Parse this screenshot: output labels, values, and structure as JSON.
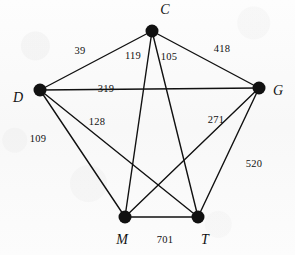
{
  "figure": {
    "width": 295,
    "height": 255,
    "background_color": "#fbfbfb",
    "ink_color": "#111111"
  },
  "nodes": [
    {
      "id": "C",
      "label": "C",
      "cx": 152,
      "cy": 31,
      "r": 6.5,
      "label_x": 165,
      "label_y": 10
    },
    {
      "id": "D",
      "label": "D",
      "cx": 40,
      "cy": 90,
      "r": 6.5,
      "label_x": 18,
      "label_y": 98
    },
    {
      "id": "G",
      "label": "G",
      "cx": 259,
      "cy": 88,
      "r": 6.5,
      "label_x": 278,
      "label_y": 91
    },
    {
      "id": "M",
      "label": "M",
      "cx": 125,
      "cy": 217,
      "r": 6.5,
      "label_x": 122,
      "label_y": 240
    },
    {
      "id": "T",
      "label": "T",
      "cx": 198,
      "cy": 217,
      "r": 6.5,
      "label_x": 205,
      "label_y": 240
    }
  ],
  "edges": [
    {
      "from": "D",
      "to": "C",
      "weight": "39",
      "label_x": 80,
      "label_y": 50
    },
    {
      "from": "C",
      "to": "M",
      "weight": "119",
      "label_x": 133,
      "label_y": 55
    },
    {
      "from": "C",
      "to": "T",
      "weight": "105",
      "label_x": 169,
      "label_y": 56
    },
    {
      "from": "C",
      "to": "G",
      "weight": "418",
      "label_x": 222,
      "label_y": 48
    },
    {
      "from": "D",
      "to": "G",
      "weight": "319",
      "label_x": 106,
      "label_y": 88
    },
    {
      "from": "D",
      "to": "T",
      "weight": "128",
      "label_x": 97,
      "label_y": 121
    },
    {
      "from": "D",
      "to": "M",
      "weight": "109",
      "label_x": 38,
      "label_y": 138
    },
    {
      "from": "G",
      "to": "M",
      "weight": "271",
      "label_x": 216,
      "label_y": 119
    },
    {
      "from": "G",
      "to": "T",
      "weight": "520",
      "label_x": 254,
      "label_y": 163
    },
    {
      "from": "M",
      "to": "T",
      "weight": "701",
      "label_x": 165,
      "label_y": 239
    }
  ],
  "chart_data": {
    "type": "diagram",
    "graph_type": "weighted-complete-graph",
    "vertex_count": 5,
    "edge_count": 10,
    "vertices": [
      "C",
      "D",
      "G",
      "M",
      "T"
    ],
    "weighted_edges": [
      {
        "endpoints": [
          "D",
          "C"
        ],
        "weight": 39
      },
      {
        "endpoints": [
          "C",
          "M"
        ],
        "weight": 119
      },
      {
        "endpoints": [
          "C",
          "T"
        ],
        "weight": 105
      },
      {
        "endpoints": [
          "C",
          "G"
        ],
        "weight": 418
      },
      {
        "endpoints": [
          "D",
          "G"
        ],
        "weight": 319
      },
      {
        "endpoints": [
          "D",
          "T"
        ],
        "weight": 128
      },
      {
        "endpoints": [
          "D",
          "M"
        ],
        "weight": 109
      },
      {
        "endpoints": [
          "G",
          "M"
        ],
        "weight": 271
      },
      {
        "endpoints": [
          "G",
          "T"
        ],
        "weight": 520
      },
      {
        "endpoints": [
          "M",
          "T"
        ],
        "weight": 701
      }
    ]
  }
}
